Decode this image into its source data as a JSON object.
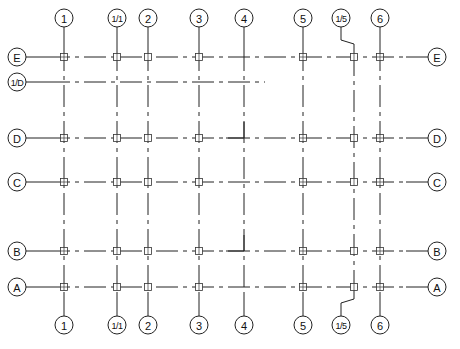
{
  "drawing": {
    "type": "structural grid plan",
    "line_color": "#222222",
    "background": "#ffffff",
    "columns": [
      {
        "label": "1",
        "x": 64
      },
      {
        "label": "1/1",
        "x": 117
      },
      {
        "label": "2",
        "x": 148
      },
      {
        "label": "3",
        "x": 199
      },
      {
        "label": "4",
        "x": 244
      },
      {
        "label": "5",
        "x": 303
      },
      {
        "label": "1/5",
        "x": 354,
        "bubble_x": 341
      },
      {
        "label": "6",
        "x": 380
      }
    ],
    "rows": [
      {
        "label": "E",
        "y": 57,
        "both_sides": true
      },
      {
        "label": "1/D",
        "y": 82,
        "both_sides": false,
        "end_x": 265
      },
      {
        "label": "D",
        "y": 138,
        "both_sides": true
      },
      {
        "label": "C",
        "y": 182,
        "both_sides": true
      },
      {
        "label": "B",
        "y": 251,
        "both_sides": true
      },
      {
        "label": "A",
        "y": 287,
        "both_sides": true
      }
    ],
    "bubble_positions": {
      "top_y": 18,
      "bottom_y": 325,
      "left_x": 17,
      "right_x": 437,
      "radius": 9
    }
  }
}
